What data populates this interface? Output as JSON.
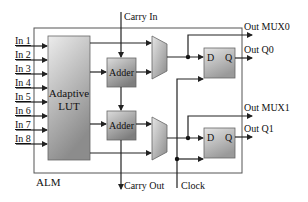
{
  "diagram": {
    "title": "ALM",
    "inputs": [
      "In 1",
      "In 2",
      "In 3",
      "In 4",
      "In 5",
      "In 6",
      "In 7",
      "In 8"
    ],
    "lut": {
      "line1": "Adaptive",
      "line2": "LUT"
    },
    "adders": [
      {
        "label": "Adder"
      },
      {
        "label": "Adder"
      }
    ],
    "flipflops": [
      {
        "d": "D",
        "q": "Q"
      },
      {
        "d": "D",
        "q": "Q"
      }
    ],
    "carry_in": "Carry In",
    "carry_out": "Carry Out",
    "clock": "Clock",
    "outputs": [
      "Out MUX0",
      "Out Q0",
      "Out MUX1",
      "Out Q1"
    ],
    "colors": {
      "block_light": "#e8e8e8",
      "block_dark": "#8a8a8a",
      "wire": "#222222",
      "border": "#555555"
    }
  }
}
